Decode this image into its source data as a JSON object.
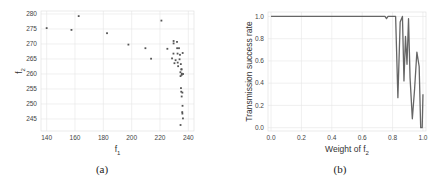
{
  "chart_data": [
    {
      "id": "a",
      "type": "scatter",
      "caption": "(a)",
      "title": "",
      "xlabel": "f1",
      "xlabel_main": "f",
      "xlabel_sub": "1",
      "ylabel": "f2",
      "ylabel_main": "f",
      "ylabel_sub": "2",
      "xlim": [
        136,
        244
      ],
      "ylim": [
        241,
        281
      ],
      "xticks": [
        140,
        160,
        180,
        200,
        220,
        240
      ],
      "yticks": [
        245,
        250,
        255,
        260,
        265,
        270,
        275,
        280
      ],
      "grid": true,
      "marker_color": "#555555",
      "points": [
        [
          140.0,
          275.3
        ],
        [
          157.5,
          274.7
        ],
        [
          162.6,
          279.3
        ],
        [
          182.6,
          273.6
        ],
        [
          197.7,
          269.8
        ],
        [
          209.7,
          268.6
        ],
        [
          213.7,
          265.1
        ],
        [
          221.0,
          277.8
        ],
        [
          225.2,
          268.4
        ],
        [
          228.5,
          265.2
        ],
        [
          229.5,
          266.8
        ],
        [
          229.6,
          271.0
        ],
        [
          229.6,
          270.2
        ],
        [
          230.2,
          263.6
        ],
        [
          231.0,
          264.6
        ],
        [
          232.0,
          270.7
        ],
        [
          232.1,
          268.6
        ],
        [
          232.4,
          266.8
        ],
        [
          232.5,
          263.8
        ],
        [
          232.8,
          262.6
        ],
        [
          233.4,
          268.6
        ],
        [
          233.8,
          264.9
        ],
        [
          234.1,
          266.4
        ],
        [
          234.4,
          260.6
        ],
        [
          234.5,
          259.3
        ],
        [
          234.7,
          263.3
        ],
        [
          235.1,
          261.5
        ],
        [
          235.2,
          261.6
        ],
        [
          235.3,
          259.7
        ],
        [
          235.4,
          260.1
        ],
        [
          234.8,
          255.3
        ],
        [
          235.0,
          254.1
        ],
        [
          235.8,
          253.8
        ],
        [
          235.3,
          252.5
        ],
        [
          235.9,
          249.4
        ],
        [
          235.7,
          247.3
        ],
        [
          235.8,
          246.8
        ],
        [
          236.2,
          245.2
        ],
        [
          234.5,
          243.0
        ],
        [
          236.0,
          267.0
        ],
        [
          236.3,
          260.0
        ]
      ]
    },
    {
      "id": "b",
      "type": "line",
      "caption": "(b)",
      "title": "",
      "xlabel": "Weight of f2",
      "xlabel_main": "Weight of f",
      "xlabel_sub": "2",
      "ylabel": "Transmission success rate",
      "xlim": [
        -0.02,
        1.02
      ],
      "ylim": [
        -0.03,
        1.04
      ],
      "xticks": [
        0.0,
        0.2,
        0.4,
        0.6,
        0.8,
        1.0
      ],
      "yticks": [
        0.0,
        0.2,
        0.4,
        0.6,
        0.8,
        1.0
      ],
      "xtick_labels": [
        "0.0",
        "0.2",
        "0.4",
        "0.6",
        "0.8",
        "1.0"
      ],
      "ytick_labels": [
        "0.0",
        "0.2",
        "0.4",
        "0.6",
        "0.8",
        "1.0"
      ],
      "grid": true,
      "line_color": "#666666",
      "x": [
        0.0,
        0.74,
        0.75,
        0.76,
        0.77,
        0.82,
        0.835,
        0.85,
        0.865,
        0.875,
        0.885,
        0.895,
        0.905,
        0.915,
        0.93,
        0.945,
        0.96,
        0.975,
        0.985,
        0.995,
        1.0
      ],
      "values": [
        1.0,
        1.0,
        1.0,
        0.98,
        1.0,
        1.0,
        0.27,
        0.95,
        1.0,
        0.42,
        0.82,
        0.57,
        0.98,
        0.45,
        0.08,
        0.35,
        0.68,
        0.55,
        0.0,
        0.0,
        0.3
      ]
    }
  ]
}
